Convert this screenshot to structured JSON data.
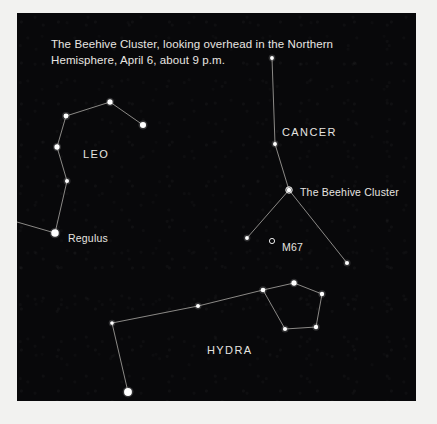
{
  "figure": {
    "caption_lines": [
      "The Beehive Cluster, looking overhead in the Northern",
      "Hemisphere, April 6, about 9 p.m."
    ],
    "background_color": "#08080a",
    "page_color": "#f2f2f0",
    "star_color": "#ffffff",
    "line_color": "#c9c7c2",
    "text_color": "#e6e4e0"
  },
  "chart_data": {
    "type": "scatter",
    "title": "The Beehive Cluster, looking overhead in the Northern Hemisphere, April 6, about 9 p.m.",
    "xlabel": "",
    "ylabel": "",
    "xlim": [
      0,
      399
    ],
    "ylim": [
      0,
      388
    ],
    "grid": false,
    "legend": "none",
    "projection": "sky-chart",
    "labels": [
      {
        "text": "LEO",
        "x": 66,
        "y": 135,
        "kind": "constellation"
      },
      {
        "text": "CANCER",
        "x": 265,
        "y": 113,
        "kind": "constellation"
      },
      {
        "text": "HYDRA",
        "x": 190,
        "y": 331,
        "kind": "constellation"
      },
      {
        "text": "The Beehive Cluster",
        "x": 283,
        "y": 173,
        "kind": "object"
      },
      {
        "text": "Regulus",
        "x": 51,
        "y": 219,
        "kind": "object"
      },
      {
        "text": "M67",
        "x": 265,
        "y": 228,
        "kind": "object"
      }
    ],
    "markers": [
      {
        "name": "beehive-cluster-marker",
        "x": 272,
        "y": 177,
        "symbol": "open-circle",
        "r": 3.2
      },
      {
        "name": "m67-marker",
        "x": 255,
        "y": 228,
        "symbol": "open-circle",
        "r": 2.6
      }
    ],
    "series": [
      {
        "name": "Leo",
        "stars": [
          {
            "label": "Epsilon Leonis",
            "x": 49,
            "y": 103,
            "mag": 2.2
          },
          {
            "label": "Zeta Leonis",
            "x": 93,
            "y": 89,
            "mag": 2.4
          },
          {
            "label": "Gamma Leonis",
            "x": 126,
            "y": 112,
            "mag": 3.0
          },
          {
            "label": "Eta Leonis",
            "x": 40,
            "y": 134,
            "mag": 2.4
          },
          {
            "label": "Algieba",
            "x": 50,
            "y": 168,
            "mag": 1.6
          },
          {
            "label": "Regulus",
            "x": 38,
            "y": 220,
            "mag": 4.0
          }
        ],
        "lines": [
          [
            49,
            103,
            93,
            89
          ],
          [
            93,
            89,
            126,
            112
          ],
          [
            49,
            103,
            40,
            134
          ],
          [
            40,
            134,
            50,
            168
          ],
          [
            50,
            168,
            38,
            220
          ],
          [
            38,
            220,
            0,
            209
          ]
        ]
      },
      {
        "name": "Cancer",
        "stars": [
          {
            "label": "Iota Cancri",
            "x": 255,
            "y": 45,
            "mag": 1.4
          },
          {
            "label": "Gamma Cancri",
            "x": 258,
            "y": 131,
            "mag": 1.5
          },
          {
            "label": "Delta Cancri",
            "x": 272,
            "y": 177,
            "mag": 1.8
          },
          {
            "label": "Beta Cancri",
            "x": 230,
            "y": 225,
            "mag": 1.4
          },
          {
            "label": "Alpha Cancri",
            "x": 330,
            "y": 250,
            "mag": 1.6
          }
        ],
        "lines": [
          [
            255,
            45,
            258,
            131
          ],
          [
            258,
            131,
            272,
            177
          ],
          [
            272,
            177,
            230,
            225
          ],
          [
            272,
            177,
            330,
            250
          ]
        ]
      },
      {
        "name": "Hydra",
        "stars": [
          {
            "label": "Alphard",
            "x": 111,
            "y": 379,
            "mag": 4.2
          },
          {
            "label": "Hydra body 1",
            "x": 95,
            "y": 310,
            "mag": 1.3
          },
          {
            "label": "Hydra body 2",
            "x": 181,
            "y": 293,
            "mag": 1.5
          },
          {
            "label": "Hydra neck",
            "x": 246,
            "y": 277,
            "mag": 2.0
          },
          {
            "label": "Head top",
            "x": 277,
            "y": 270,
            "mag": 2.4
          },
          {
            "label": "Head right",
            "x": 305,
            "y": 281,
            "mag": 1.8
          },
          {
            "label": "Head low-r",
            "x": 299,
            "y": 314,
            "mag": 1.8
          },
          {
            "label": "Head low-l",
            "x": 268,
            "y": 316,
            "mag": 1.6
          }
        ],
        "lines": [
          [
            111,
            379,
            95,
            310
          ],
          [
            95,
            310,
            181,
            293
          ],
          [
            181,
            293,
            246,
            277
          ],
          [
            246,
            277,
            277,
            270
          ],
          [
            277,
            270,
            305,
            281
          ],
          [
            305,
            281,
            299,
            314
          ],
          [
            299,
            314,
            268,
            316
          ],
          [
            268,
            316,
            246,
            277
          ]
        ]
      }
    ]
  }
}
